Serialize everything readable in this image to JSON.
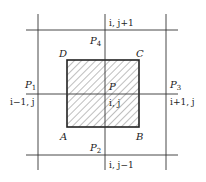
{
  "diagram": {
    "colors": {
      "line": "#333333",
      "hatch": "#444444",
      "background": "#ffffff"
    },
    "grid": {
      "vlines_x": [
        38,
        105,
        166
      ],
      "hlines_y": [
        30,
        94,
        155
      ],
      "extent": {
        "x1": 26,
        "x2": 178,
        "y1": 14,
        "y2": 170
      }
    },
    "control_volume": {
      "x": 67,
      "y": 60,
      "w": 72,
      "h": 67,
      "hatched": true
    },
    "corners": {
      "A": "A",
      "B": "B",
      "C": "C",
      "D": "D"
    },
    "nodes": {
      "P": {
        "name": "P",
        "index": "i, j"
      },
      "P1": {
        "name": "P",
        "sub": "1",
        "index": "i−1, j"
      },
      "P2": {
        "name": "P",
        "sub": "2",
        "index": "i, j−1"
      },
      "P3": {
        "name": "P",
        "sub": "3",
        "index": "i+1, j"
      },
      "P4": {
        "name": "P",
        "sub": "4",
        "index": "i, j+1"
      }
    }
  }
}
